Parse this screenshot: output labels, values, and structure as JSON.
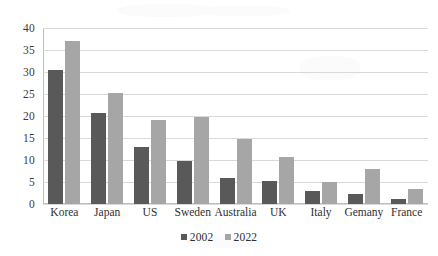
{
  "chart_data": {
    "type": "bar",
    "title": "",
    "subtitle": "",
    "xlabel": "",
    "ylabel": "",
    "ylim": [
      0,
      40
    ],
    "ytick_step": 5,
    "yticks": [
      40,
      35,
      30,
      25,
      20,
      15,
      10,
      5,
      0
    ],
    "grid": true,
    "legend_position": "bottom-center",
    "categories": [
      "Korea",
      "Japan",
      "US",
      "Sweden",
      "Australia",
      "UK",
      "Italy",
      "Gemany",
      "France"
    ],
    "series": [
      {
        "name": "2002",
        "color": "#595959",
        "values": [
          30.5,
          20.7,
          12.9,
          9.7,
          6.0,
          5.2,
          3.0,
          2.3,
          1.2
        ]
      },
      {
        "name": "2022",
        "color": "#a6a6a6",
        "values": [
          37.0,
          25.3,
          19.0,
          19.8,
          14.7,
          10.7,
          4.9,
          7.9,
          3.4
        ]
      }
    ]
  },
  "colors": {
    "series_2002": "#595959",
    "series_2022": "#a6a6a6",
    "gridline": "#d9d9d9",
    "axis": "#bfbfbf",
    "background": "#ffffff",
    "text": "#2f2f2f"
  }
}
